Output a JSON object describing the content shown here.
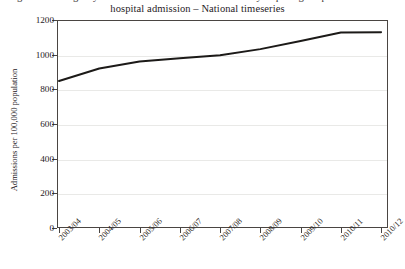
{
  "chart_data": {
    "type": "line",
    "title": "hospital admission – National timeseries",
    "title_line_1": "Figure 1: Emergency admissions for conditions not usually requiring hospital admission",
    "title_line_2": "hospital admission – National timeseries",
    "xlabel": "",
    "ylabel": "Admissions per 100,000 population",
    "categories": [
      "2003/04",
      "2004/05",
      "2005/06",
      "2006/07",
      "2007/08",
      "2008/09",
      "2009/10",
      "2010/11",
      "2010/12"
    ],
    "values": [
      848,
      920,
      961,
      979,
      997,
      1032,
      1079,
      1128,
      1130
    ],
    "ylim": [
      0,
      1200
    ],
    "yticks": [
      0,
      200,
      400,
      600,
      800,
      1000,
      1200
    ],
    "ytick_labels": [
      "0",
      "200",
      "400",
      "600",
      "800",
      "1000",
      "1200"
    ],
    "grid": true,
    "legend": false,
    "series_color": "#1c1a18",
    "line_width": 2
  },
  "axis": {
    "frame_color": "#4a4542",
    "grid_color": "#e9e9e7"
  }
}
